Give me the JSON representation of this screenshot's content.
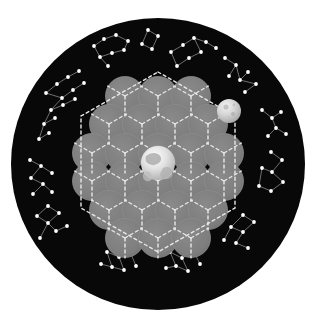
{
  "figure": {
    "canvas": {
      "width": 319,
      "height": 327,
      "background_color": "#ffffff"
    },
    "disk": {
      "name": "star-field-disk",
      "center_x": 158,
      "center_y": 164,
      "radius_x": 147,
      "radius_y": 146,
      "fill_color": "#080808",
      "description": "Black circular sky disk filling the frame"
    },
    "center_body": {
      "name": "earth-globe",
      "label": "Earth",
      "cx": 158,
      "cy": 163,
      "r": 17,
      "base_color": "#d8d8d8",
      "description": "Bright textured globe at the centre of the sphere packing"
    },
    "secondary_body": {
      "name": "moon-globe",
      "label": "Moon",
      "cx": 229,
      "cy": 111,
      "r": 12,
      "base_color": "#cfcfcf",
      "description": "Smaller cratered sphere at the upper right of the packing"
    },
    "sphere_pack": {
      "name": "gray-sphere-cluster",
      "fill_color": "#7e7e7e",
      "edge_color": "#8d8d8d",
      "radius": 19.5,
      "spacing_x": 33.0,
      "spacing_y": 28.6,
      "rows": [
        {
          "count": 3,
          "y": 96
        },
        {
          "count": 4,
          "y": 124
        },
        {
          "count": 5,
          "y": 153
        },
        {
          "count": 5,
          "y": 181
        },
        {
          "count": 4,
          "y": 210
        },
        {
          "count": 3,
          "y": 238
        }
      ],
      "total_spheres": 24,
      "description": "Hexagonal close packing of equal gray circles"
    },
    "lattice": {
      "name": "dashed-hex-lattice",
      "stroke_color": "#e8e8e8",
      "stroke_width": 1.4,
      "dash_pattern": "3 3",
      "description": "White dashed hexagonal cell boundaries and radial spokes"
    },
    "starfield": {
      "name": "constellation-ring",
      "star_color": "#ffffff",
      "line_color": "#9c9c9c",
      "star_radius": 1.9,
      "constellation_count": 12,
      "description": "Ring of constellation star patterns around the sphere packing"
    }
  },
  "chart_data": {
    "type": "scatter",
    "xlabel": "",
    "ylabel": "",
    "grid": false,
    "legend": "none",
    "sphere_centers": [
      [
        125,
        96
      ],
      [
        158,
        96
      ],
      [
        191,
        96
      ],
      [
        109,
        124
      ],
      [
        142,
        124
      ],
      [
        175,
        124
      ],
      [
        208,
        124
      ],
      [
        92,
        153
      ],
      [
        125,
        153
      ],
      [
        158,
        153
      ],
      [
        191,
        153
      ],
      [
        224,
        153
      ],
      [
        92,
        181
      ],
      [
        125,
        181
      ],
      [
        158,
        181
      ],
      [
        191,
        181
      ],
      [
        224,
        181
      ],
      [
        109,
        210
      ],
      [
        142,
        210
      ],
      [
        175,
        210
      ],
      [
        208,
        210
      ],
      [
        125,
        238
      ],
      [
        158,
        238
      ],
      [
        191,
        238
      ]
    ],
    "hex_outline": [
      [
        158,
        72
      ],
      [
        235,
        116
      ],
      [
        235,
        208
      ],
      [
        158,
        252
      ],
      [
        81,
        208
      ],
      [
        81,
        116
      ]
    ],
    "constellations": [
      {
        "name": "north-west-group",
        "stars": [
          [
            46,
            93
          ],
          [
            57,
            84
          ],
          [
            68,
            77
          ],
          [
            79,
            71
          ],
          [
            62,
            98
          ],
          [
            73,
            90
          ],
          [
            84,
            83
          ],
          [
            51,
            110
          ],
          [
            63,
            105
          ],
          [
            75,
            99
          ],
          [
            44,
            124
          ],
          [
            55,
            118
          ],
          [
            39,
            139
          ],
          [
            49,
            133
          ]
        ],
        "links": [
          [
            0,
            1
          ],
          [
            1,
            2
          ],
          [
            2,
            3
          ],
          [
            0,
            4
          ],
          [
            4,
            5
          ],
          [
            5,
            6
          ],
          [
            4,
            7
          ],
          [
            7,
            8
          ],
          [
            8,
            9
          ],
          [
            7,
            10
          ],
          [
            10,
            11
          ],
          [
            10,
            12
          ],
          [
            12,
            13
          ]
        ]
      },
      {
        "name": "north-group-a",
        "stars": [
          [
            94,
            46
          ],
          [
            104,
            39
          ],
          [
            116,
            35
          ],
          [
            128,
            41
          ],
          [
            100,
            57
          ],
          [
            112,
            53
          ],
          [
            124,
            50
          ],
          [
            108,
            66
          ]
        ],
        "links": [
          [
            0,
            1
          ],
          [
            1,
            2
          ],
          [
            2,
            3
          ],
          [
            0,
            4
          ],
          [
            4,
            5
          ],
          [
            5,
            6
          ],
          [
            4,
            7
          ],
          [
            6,
            3
          ]
        ]
      },
      {
        "name": "north-group-b",
        "stars": [
          [
            148,
            30
          ],
          [
            158,
            36
          ],
          [
            152,
            49
          ],
          [
            142,
            44
          ]
        ],
        "links": [
          [
            0,
            1
          ],
          [
            1,
            2
          ],
          [
            2,
            3
          ],
          [
            3,
            0
          ]
        ]
      },
      {
        "name": "north-east-group",
        "stars": [
          [
            171,
            52
          ],
          [
            183,
            45
          ],
          [
            194,
            38
          ],
          [
            177,
            66
          ],
          [
            189,
            58
          ],
          [
            201,
            52
          ],
          [
            206,
            42
          ],
          [
            216,
            48
          ]
        ],
        "links": [
          [
            0,
            1
          ],
          [
            1,
            2
          ],
          [
            0,
            3
          ],
          [
            3,
            4
          ],
          [
            4,
            5
          ],
          [
            5,
            2
          ],
          [
            2,
            6
          ],
          [
            6,
            7
          ]
        ]
      },
      {
        "name": "east-upper-group",
        "stars": [
          [
            225,
            58
          ],
          [
            236,
            65
          ],
          [
            229,
            76
          ],
          [
            240,
            80
          ],
          [
            248,
            72
          ],
          [
            256,
            84
          ],
          [
            245,
            92
          ]
        ],
        "links": [
          [
            0,
            1
          ],
          [
            1,
            2
          ],
          [
            1,
            3
          ],
          [
            3,
            4
          ],
          [
            3,
            5
          ],
          [
            5,
            6
          ]
        ]
      },
      {
        "name": "east-group",
        "stars": [
          [
            262,
            110
          ],
          [
            272,
            118
          ],
          [
            281,
            112
          ],
          [
            276,
            128
          ],
          [
            286,
            134
          ],
          [
            268,
            136
          ]
        ],
        "links": [
          [
            0,
            1
          ],
          [
            1,
            2
          ],
          [
            1,
            3
          ],
          [
            3,
            4
          ],
          [
            3,
            5
          ]
        ]
      },
      {
        "name": "east-lower-group",
        "stars": [
          [
            271,
            152
          ],
          [
            282,
            160
          ],
          [
            272,
            172
          ],
          [
            283,
            182
          ],
          [
            271,
            191
          ],
          [
            259,
            186
          ],
          [
            262,
            168
          ]
        ],
        "links": [
          [
            0,
            1
          ],
          [
            1,
            2
          ],
          [
            2,
            3
          ],
          [
            3,
            4
          ],
          [
            4,
            5
          ],
          [
            5,
            6
          ],
          [
            6,
            2
          ]
        ]
      },
      {
        "name": "south-east-group",
        "stars": [
          [
            243,
            215
          ],
          [
            254,
            222
          ],
          [
            243,
            232
          ],
          [
            231,
            227
          ],
          [
            236,
            243
          ],
          [
            248,
            248
          ],
          [
            224,
            240
          ]
        ],
        "links": [
          [
            0,
            1
          ],
          [
            1,
            2
          ],
          [
            2,
            3
          ],
          [
            3,
            0
          ],
          [
            2,
            4
          ],
          [
            4,
            5
          ],
          [
            3,
            6
          ]
        ]
      },
      {
        "name": "south-group",
        "stars": [
          [
            170,
            252
          ],
          [
            182,
            258
          ],
          [
            194,
            252
          ],
          [
            176,
            266
          ],
          [
            188,
            271
          ],
          [
            166,
            268
          ],
          [
            200,
            264
          ]
        ],
        "links": [
          [
            0,
            1
          ],
          [
            1,
            2
          ],
          [
            0,
            3
          ],
          [
            3,
            4
          ],
          [
            4,
            1
          ],
          [
            3,
            5
          ],
          [
            2,
            6
          ]
        ]
      },
      {
        "name": "south-west-group",
        "stars": [
          [
            107,
            252
          ],
          [
            119,
            257
          ],
          [
            131,
            254
          ],
          [
            112,
            267
          ],
          [
            124,
            270
          ],
          [
            101,
            264
          ],
          [
            136,
            266
          ]
        ],
        "links": [
          [
            0,
            1
          ],
          [
            1,
            2
          ],
          [
            0,
            3
          ],
          [
            3,
            4
          ],
          [
            4,
            1
          ],
          [
            3,
            5
          ],
          [
            2,
            6
          ]
        ]
      },
      {
        "name": "west-lower-group",
        "stars": [
          [
            48,
            206
          ],
          [
            59,
            213
          ],
          [
            48,
            223
          ],
          [
            37,
            216
          ],
          [
            56,
            231
          ],
          [
            67,
            226
          ],
          [
            40,
            238
          ]
        ],
        "links": [
          [
            0,
            1
          ],
          [
            1,
            2
          ],
          [
            2,
            3
          ],
          [
            3,
            0
          ],
          [
            2,
            4
          ],
          [
            4,
            5
          ],
          [
            2,
            6
          ]
        ]
      },
      {
        "name": "west-group",
        "stars": [
          [
            30,
            160
          ],
          [
            41,
            166
          ],
          [
            31,
            178
          ],
          [
            43,
            184
          ],
          [
            33,
            194
          ],
          [
            52,
            173
          ],
          [
            52,
            192
          ]
        ],
        "links": [
          [
            0,
            1
          ],
          [
            1,
            2
          ],
          [
            2,
            3
          ],
          [
            3,
            4
          ],
          [
            1,
            5
          ],
          [
            3,
            6
          ]
        ]
      }
    ]
  }
}
